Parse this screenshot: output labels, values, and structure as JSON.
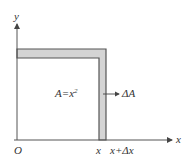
{
  "diagram": {
    "axes": {
      "x_label": "x",
      "y_label": "y",
      "origin_label": "O"
    },
    "square": {
      "area_label": "A=x",
      "area_exponent": "2"
    },
    "strip": {
      "label": "ΔA"
    },
    "ticks": {
      "x": "x",
      "x_plus_dx": "x+Δx"
    },
    "colors": {
      "line": "#555555",
      "strip_fill": "#d4d4d4",
      "text": "#333333"
    }
  }
}
